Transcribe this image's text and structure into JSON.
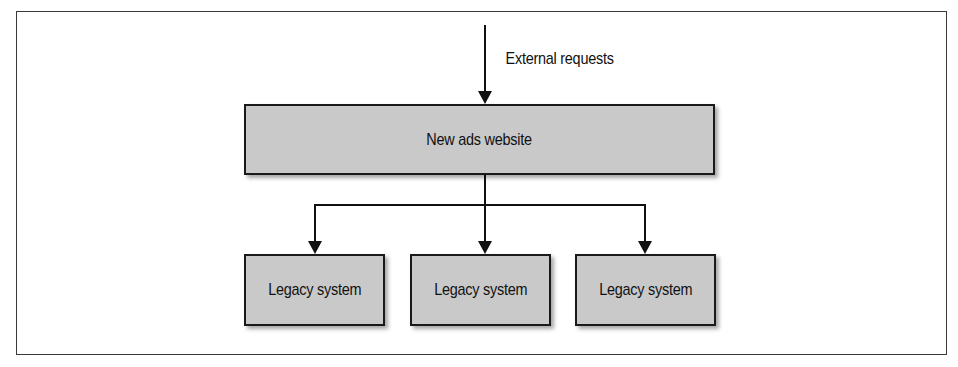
{
  "diagram": {
    "external_label": "External requests",
    "main_box": {
      "label": "New ads website"
    },
    "children": [
      {
        "label": "Legacy system"
      },
      {
        "label": "Legacy system"
      },
      {
        "label": "Legacy system"
      }
    ],
    "colors": {
      "box_fill": "#c9c9c9",
      "stroke": "#1a1a1a",
      "frame": "#3a3a3a"
    }
  }
}
